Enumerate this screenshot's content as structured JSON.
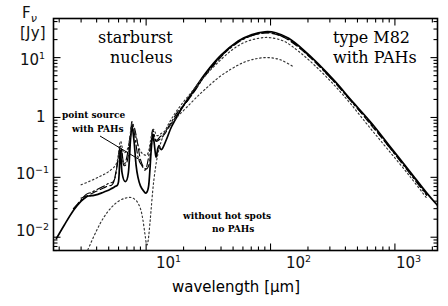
{
  "figure": {
    "axis_labels": {
      "y_symbol": "F",
      "y_subscript": "ν",
      "y_unit": "[Jy]",
      "x_title": "wavelength [μm]"
    },
    "annotations": [
      {
        "id": "starburst-nucleus",
        "line1": "starburst",
        "line2": "nucleus"
      },
      {
        "id": "type-m82",
        "line1": "type M82",
        "line2": "with PAHs"
      },
      {
        "id": "point-source",
        "line1": "point source",
        "line2": "with PAHs"
      },
      {
        "id": "without-hot-spots",
        "line1": "without hot spots",
        "line2": "no PAHs"
      }
    ],
    "colors": {
      "ink": "#000000",
      "background": "#ffffff"
    }
  },
  "chart_data": {
    "type": "line",
    "title": "",
    "xlabel": "wavelength [μm]",
    "ylabel": "F_nu [Jy]",
    "xscale": "log",
    "yscale": "log",
    "xlim": [
      1.8,
      2200
    ],
    "ylim": [
      0.006,
      45
    ],
    "grid": false,
    "legend": "none",
    "xticks": [
      10,
      100,
      1000
    ],
    "xtick_labels": [
      "10¹",
      "10²",
      "10³"
    ],
    "yticks": [
      0.01,
      0.1,
      1,
      10
    ],
    "ytick_labels": [
      "10⁻²",
      "10⁻¹",
      "1",
      "10¹"
    ],
    "series": [
      {
        "name": "starburst nucleus (solid)",
        "style": "solid",
        "x": [
          1.9,
          2.2,
          2.6,
          3.0,
          3.3,
          3.5,
          3.8,
          4.1,
          4.4,
          4.8,
          5.2,
          5.6,
          6.0,
          6.2,
          6.4,
          6.8,
          7.2,
          7.5,
          7.7,
          8.0,
          8.3,
          8.6,
          9.0,
          9.5,
          10.0,
          10.5,
          11.0,
          11.3,
          11.6,
          12.0,
          12.4,
          12.7,
          13.0,
          13.5,
          14.5,
          16.0,
          18.0,
          20.0,
          24.0,
          30.0,
          40.0,
          55.0,
          70.0,
          90.0,
          110.0,
          140.0,
          180.0,
          240.0,
          330.0,
          450.0,
          650.0,
          900.0,
          1300.0,
          1800.0,
          2200.0
        ],
        "y": [
          0.0095,
          0.016,
          0.028,
          0.04,
          0.047,
          0.049,
          0.05,
          0.052,
          0.055,
          0.059,
          0.064,
          0.07,
          0.085,
          0.28,
          0.12,
          0.085,
          0.12,
          0.45,
          0.7,
          0.4,
          0.16,
          0.1,
          0.072,
          0.06,
          0.055,
          0.075,
          0.3,
          0.52,
          0.38,
          0.22,
          0.3,
          0.34,
          0.3,
          0.3,
          0.42,
          0.7,
          1.1,
          1.6,
          2.8,
          5.5,
          11.0,
          19.0,
          24.0,
          27.0,
          26.0,
          21.0,
          14.0,
          8.0,
          4.0,
          1.9,
          0.8,
          0.34,
          0.13,
          0.055,
          0.034
        ]
      },
      {
        "name": "point source with PAHs (dash-dot)",
        "style": "dashdot",
        "x": [
          2.6,
          3.0,
          3.3,
          3.6,
          4.0,
          4.5,
          5.0,
          5.6,
          6.2,
          6.6,
          7.0,
          7.5,
          7.7,
          8.1,
          8.6,
          9.2,
          10.0,
          11.0,
          11.3,
          12.0,
          13.0,
          14.0,
          16.0,
          18.0,
          21.0,
          25.0,
          30.0,
          40.0,
          55.0,
          70.0,
          90.0,
          110.0,
          140.0,
          180.0,
          240.0,
          330.0,
          450.0,
          650.0,
          900.0,
          1300.0,
          1800.0
        ],
        "y": [
          0.03,
          0.042,
          0.052,
          0.056,
          0.062,
          0.07,
          0.08,
          0.095,
          0.33,
          0.17,
          0.22,
          0.55,
          0.85,
          0.5,
          0.22,
          0.16,
          0.14,
          0.42,
          0.62,
          0.42,
          0.48,
          0.55,
          0.85,
          1.25,
          1.8,
          2.9,
          5.2,
          10.5,
          18.0,
          23.0,
          26.0,
          25.0,
          20.0,
          13.5,
          7.6,
          3.8,
          1.8,
          0.76,
          0.32,
          0.12,
          0.05
        ]
      },
      {
        "name": "intermediate model (dashed)",
        "style": "dashed",
        "x": [
          3.0,
          3.4,
          3.8,
          4.3,
          4.9,
          5.5,
          6.2,
          6.6,
          7.1,
          7.6,
          7.9,
          8.4,
          9.0,
          9.8,
          10.6,
          11.3,
          12.0,
          13.0,
          14.0,
          16.0,
          19.0,
          23.0,
          28.0,
          36.0,
          48.0,
          62.0,
          80.0,
          100.0,
          130.0,
          170.0,
          230.0,
          320.0,
          440.0,
          620.0,
          880.0,
          1300.0,
          1800.0
        ],
        "y": [
          0.045,
          0.05,
          0.056,
          0.063,
          0.072,
          0.085,
          0.3,
          0.16,
          0.2,
          0.6,
          0.75,
          0.45,
          0.2,
          0.14,
          0.17,
          0.5,
          0.4,
          0.44,
          0.52,
          0.8,
          1.35,
          2.3,
          4.2,
          8.0,
          15.0,
          21.0,
          25.0,
          25.5,
          21.5,
          14.5,
          8.3,
          4.1,
          1.95,
          0.82,
          0.34,
          0.125,
          0.052
        ]
      },
      {
        "name": "without hot spots, no PAHs (dotted, cool component)",
        "style": "dotted",
        "x": [
          3.4,
          4.0,
          4.6,
          5.3,
          6.0,
          6.8,
          7.6,
          8.4,
          9.0,
          9.4,
          9.8,
          10.1,
          10.4,
          10.8,
          11.5,
          12.5,
          14.0,
          16.0,
          19.0,
          23.0,
          28.0,
          36.0,
          48.0,
          62.0,
          80.0,
          100.0,
          130.0,
          170.0,
          230.0,
          320.0,
          440.0,
          620.0,
          880.0,
          1300.0,
          1800.0
        ],
        "y": [
          0.0062,
          0.013,
          0.022,
          0.032,
          0.04,
          0.045,
          0.046,
          0.04,
          0.03,
          0.02,
          0.011,
          0.0075,
          0.009,
          0.02,
          0.085,
          0.26,
          0.55,
          0.95,
          1.6,
          2.6,
          4.3,
          7.5,
          13.0,
          18.0,
          21.0,
          21.5,
          18.5,
          12.5,
          7.2,
          3.6,
          1.7,
          0.7,
          0.29,
          0.108,
          0.045
        ]
      },
      {
        "name": "hot dust envelope (dotted, upper)",
        "style": "dotted",
        "x": [
          3.0,
          3.6,
          4.3,
          5.0,
          5.8,
          6.2,
          6.6,
          7.2,
          7.7,
          8.2,
          8.8,
          9.6,
          10.4,
          11.3,
          12.2,
          13.2,
          14.5,
          16.0,
          18.0,
          21.0,
          25.0,
          30.0,
          38.0,
          48.0,
          60.0,
          75.0,
          95.0,
          120.0,
          150.0
        ],
        "y": [
          0.075,
          0.088,
          0.105,
          0.125,
          0.175,
          0.4,
          0.26,
          0.33,
          0.8,
          0.52,
          0.3,
          0.24,
          0.26,
          0.62,
          0.5,
          0.54,
          0.62,
          0.8,
          1.05,
          1.45,
          2.1,
          3.0,
          4.6,
          6.4,
          8.2,
          9.5,
          10.0,
          9.2,
          7.2
        ]
      }
    ],
    "annotations": [
      {
        "text": "starburst nucleus",
        "x_data": 4.5,
        "y_data": 18.0
      },
      {
        "text": "type M82 with PAHs",
        "x_data": 420.0,
        "y_data": 18.0
      },
      {
        "text": "point source with PAHs",
        "x_data": 2.6,
        "y_data": 0.55
      },
      {
        "text": "without hot spots no PAHs",
        "x_data": 17.0,
        "y_data": 0.022
      }
    ]
  }
}
